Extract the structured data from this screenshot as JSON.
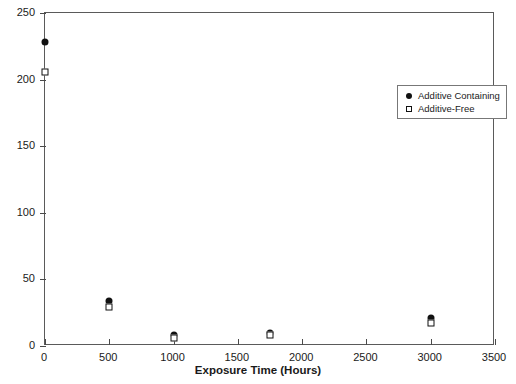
{
  "chart_data": {
    "type": "scatter",
    "title": "",
    "xlabel": "Exposure Time (Hours)",
    "ylabel": "Fracture Energy (J/m²)",
    "xlim": [
      0,
      3500
    ],
    "ylim": [
      0,
      250
    ],
    "xticks": [
      0,
      500,
      1000,
      1500,
      2000,
      2500,
      3000,
      3500
    ],
    "xtick_labels": [
      "0",
      "500",
      "1000",
      "1500",
      "2000",
      "2500",
      "3000",
      "3500"
    ],
    "yticks": [
      0,
      50,
      100,
      150,
      200,
      250
    ],
    "ytick_labels": [
      "0",
      "50",
      "100",
      "150",
      "200",
      "250"
    ],
    "grid": false,
    "legend_position": "upper-right-inset",
    "series": [
      {
        "name": "Additive Containing",
        "marker": "filled-circle",
        "color": "#111111",
        "points": [
          {
            "x": 0,
            "y": 228
          },
          {
            "x": 500,
            "y": 34
          },
          {
            "x": 1000,
            "y": 8
          },
          {
            "x": 1750,
            "y": 10
          },
          {
            "x": 3000,
            "y": 21
          }
        ]
      },
      {
        "name": "Additive-Free",
        "marker": "open-square",
        "color": "#111111",
        "points": [
          {
            "x": 0,
            "y": 206
          },
          {
            "x": 500,
            "y": 29
          },
          {
            "x": 1000,
            "y": 6
          },
          {
            "x": 1750,
            "y": 8
          },
          {
            "x": 3000,
            "y": 17
          }
        ]
      }
    ]
  },
  "legend": {
    "entries": [
      {
        "label": "Additive Containing",
        "marker": "filled-circle"
      },
      {
        "label": "Additive-Free",
        "marker": "open-square"
      }
    ]
  }
}
